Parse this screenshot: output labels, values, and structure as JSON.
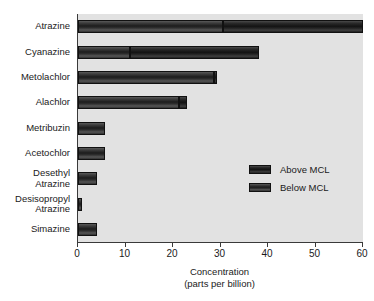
{
  "chart_data": {
    "type": "bar",
    "orientation": "horizontal",
    "stacked": true,
    "title": "",
    "xlabel": "Concentration\n(parts per billion)",
    "xlabel_line1": "Concentration",
    "xlabel_line2": "(parts per billion)",
    "ylabel": "",
    "xlim": [
      0,
      60
    ],
    "xticks": [
      0,
      10,
      20,
      30,
      40,
      50,
      60
    ],
    "xticklabels": [
      "0",
      "10",
      "20",
      "30",
      "40",
      "50",
      "60"
    ],
    "grid": false,
    "legend_position": "middle-right",
    "categories": [
      "Atrazine",
      "Cyanazine",
      "Metolachlor",
      "Alachlor",
      "Metribuzin",
      "Acetochlor",
      "Desethyl\nAtrazine",
      "Desisopropyl\nAtrazine",
      "Simazine"
    ],
    "series": [
      {
        "name": "Below MCL",
        "color": "#2b2b2b",
        "values": [
          30.6,
          11.0,
          28.6,
          21.2,
          5.7,
          5.7,
          4.0,
          0.8,
          4.0
        ]
      },
      {
        "name": "Above MCL",
        "color": "#151515",
        "values": [
          29.4,
          27.2,
          0.6,
          1.8,
          0.0,
          0.0,
          0.0,
          0.0,
          0.0
        ]
      }
    ],
    "totals": [
      60.0,
      38.2,
      29.2,
      23.0,
      5.7,
      5.7,
      4.0,
      0.8,
      4.0
    ]
  },
  "legend": {
    "items": [
      {
        "label": "Above MCL",
        "color": "#151515"
      },
      {
        "label": "Below MCL",
        "color": "#2b2b2b"
      }
    ]
  },
  "colors": {
    "plot_background": "#e2e2e2",
    "axis": "#3a3a3a",
    "text": "#1a1a1a",
    "page_background": "#ffffff"
  }
}
